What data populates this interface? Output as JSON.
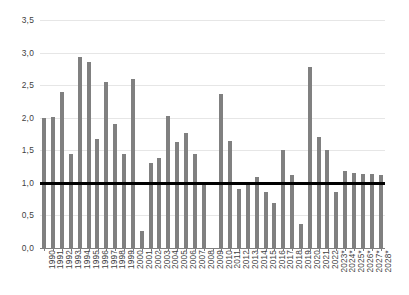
{
  "chart_data": {
    "type": "bar",
    "title": "",
    "subtitle": "",
    "xlabel": "",
    "ylabel": "",
    "ylim": [
      0,
      3.5
    ],
    "ytick_step": 0.5,
    "grid": true,
    "legend": false,
    "decimal_separator": ",",
    "bar_color": "#808080",
    "gridline_color": "#e6e6e6",
    "axis_color": "#7f7f7f",
    "reference_line": {
      "name": "reference-line-1",
      "value": 1.0,
      "color": "#000000",
      "width_px": 3
    },
    "ytick_labels": [
      "3,5",
      "3,0",
      "2,5",
      "2,0",
      "1,5",
      "1,0",
      "0,5",
      "0,0"
    ],
    "ytick_values": [
      3.5,
      3.0,
      2.5,
      2.0,
      1.5,
      1.0,
      0.5,
      0.0
    ],
    "categories": [
      "1990",
      "1991",
      "1992",
      "1993",
      "1994",
      "1995",
      "1996",
      "1997",
      "1998",
      "1999",
      "2000",
      "2001",
      "2002",
      "2003",
      "2004",
      "2005",
      "2006",
      "2007",
      "2008",
      "2009",
      "2010",
      "2011",
      "2012",
      "2013",
      "2014",
      "2015",
      "2016",
      "2017",
      "2018",
      "2019",
      "2020",
      "2021",
      "2022",
      "2023*",
      "2024*",
      "2025*",
      "2026*",
      "2027*",
      "2028*"
    ],
    "values": [
      2.0,
      2.01,
      2.39,
      1.45,
      2.93,
      2.85,
      1.68,
      2.55,
      1.9,
      1.44,
      2.59,
      0.26,
      1.31,
      1.38,
      2.02,
      1.63,
      1.76,
      1.44,
      1.0,
      0.0,
      2.36,
      1.64,
      0.91,
      1.0,
      1.09,
      0.86,
      0.69,
      1.51,
      1.12,
      0.37,
      2.78,
      1.7,
      1.51,
      0.86,
      1.18,
      1.15,
      1.14,
      1.14,
      1.12
    ]
  }
}
